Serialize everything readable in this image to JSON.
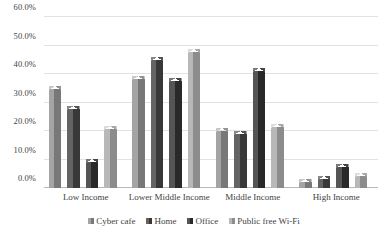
{
  "chart_data": {
    "type": "bar",
    "title": "",
    "subtitle": "",
    "xlabel": "",
    "ylabel": "",
    "ylim": [
      0,
      60
    ],
    "ytick_labels": [
      "0.0%",
      "10.0%",
      "20.0%",
      "30.0%",
      "40.0%",
      "50.0%",
      "60.0%"
    ],
    "ytick_values": [
      0,
      10,
      20,
      30,
      40,
      50,
      60
    ],
    "grid": true,
    "legend_position": "bottom",
    "units": "percent",
    "categories": [
      "Low Income",
      "Lower Middle Income",
      "Middle Income",
      "High Income"
    ],
    "series": [
      {
        "name": "Cyber cafe",
        "color": "#8a8a8a",
        "values": [
          35.8,
          39.3,
          20.9,
          3.3
        ]
      },
      {
        "name": "Home",
        "color": "#4a4a4a",
        "values": [
          28.8,
          46.1,
          20.0,
          4.2
        ]
      },
      {
        "name": "Office",
        "color": "#3b3b3b",
        "values": [
          10.3,
          38.6,
          42.1,
          8.3
        ]
      },
      {
        "name": "Public free Wi-Fi",
        "color": "#9e9e9e",
        "values": [
          21.6,
          48.8,
          22.4,
          5.4
        ]
      }
    ]
  },
  "legend": {
    "items": [
      {
        "label": "Cyber cafe"
      },
      {
        "label": "Home"
      },
      {
        "label": "Office"
      },
      {
        "label": "Public free Wi-Fi"
      }
    ]
  }
}
